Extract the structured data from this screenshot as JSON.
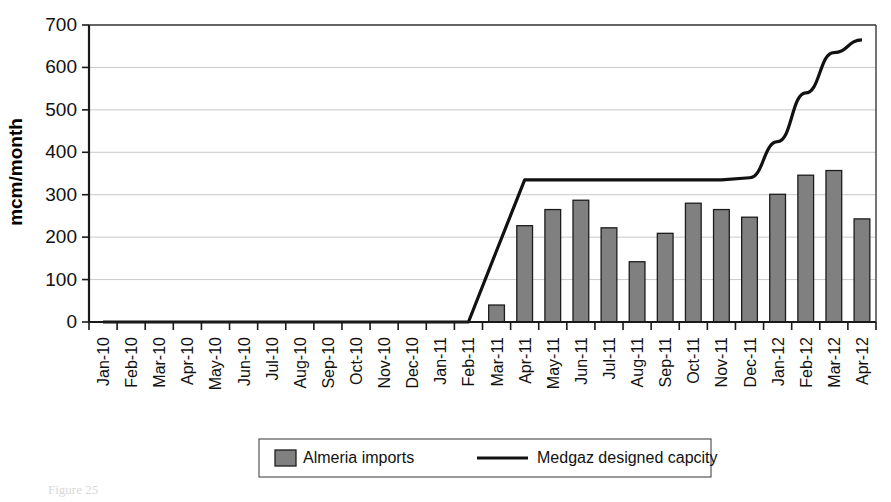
{
  "chart_data": {
    "type": "bar",
    "title": "",
    "subtitle": "",
    "xlabel": "",
    "ylabel": "mcm/month",
    "ylim": [
      0,
      700
    ],
    "ytick_step": 100,
    "yticks": [
      "0",
      "100",
      "200",
      "300",
      "400",
      "500",
      "600",
      "700"
    ],
    "grid": true,
    "legend_position": "bottom",
    "categories": [
      "Jan-10",
      "Feb-10",
      "Mar-10",
      "Apr-10",
      "May-10",
      "Jun-10",
      "Jul-10",
      "Aug-10",
      "Sep-10",
      "Oct-10",
      "Nov-10",
      "Dec-10",
      "Jan-11",
      "Feb-11",
      "Mar-11",
      "Apr-11",
      "May-11",
      "Jun-11",
      "Jul-11",
      "Aug-11",
      "Sep-11",
      "Oct-11",
      "Nov-11",
      "Dec-11",
      "Jan-12",
      "Feb-12",
      "Mar-12",
      "Apr-12"
    ],
    "series": [
      {
        "name": "Almeria imports",
        "type": "bar",
        "color": "#808080",
        "values": [
          0,
          0,
          0,
          0,
          0,
          0,
          0,
          0,
          0,
          0,
          0,
          0,
          0,
          0,
          40,
          227,
          265,
          287,
          222,
          142,
          209,
          280,
          265,
          247,
          301,
          346,
          357,
          243
        ]
      },
      {
        "name": "Medgaz designed capcity",
        "type": "line",
        "color": "#111111",
        "values": [
          0,
          0,
          0,
          0,
          0,
          0,
          0,
          0,
          0,
          0,
          0,
          0,
          0,
          0,
          168,
          335,
          335,
          335,
          335,
          335,
          335,
          335,
          335,
          340,
          425,
          540,
          635,
          665
        ]
      }
    ]
  },
  "legend": {
    "entries": [
      {
        "label": "Almeria imports",
        "marker": "bar-swatch"
      },
      {
        "label": "Medgaz designed capcity",
        "marker": "line-swatch"
      }
    ]
  },
  "caption": {
    "text": "Figure 25"
  },
  "colors": {
    "bar_fill": "#808080",
    "bar_stroke": "#1c1c1c",
    "line": "#111111",
    "gridline": "#c9c9c9",
    "axis": "#1a1a1a",
    "background": "#ffffff"
  }
}
